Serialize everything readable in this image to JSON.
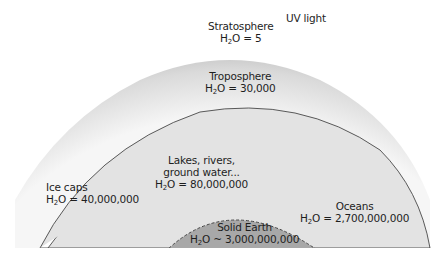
{
  "diagram": {
    "type": "earth water reservoirs cross-section",
    "labels": {
      "uv": {
        "text": "UV light"
      },
      "stratosphere": {
        "name": "Stratosphere",
        "value": "= 5"
      },
      "troposphere": {
        "name": "Troposphere",
        "value": "= 30,000"
      },
      "lakes": {
        "line1": "Lakes, rivers,",
        "line2": "ground water...",
        "value": "= 80,000,000"
      },
      "icecaps": {
        "name": "Ice caps",
        "value": "= 40,000,000"
      },
      "oceans": {
        "name": "Oceans",
        "value": "= 2,700,000,000"
      },
      "solid_earth": {
        "name": "Solid Earth",
        "value": "~ 3,000,000,000"
      }
    },
    "formula": {
      "h": "H",
      "sub": "2",
      "o": "O"
    },
    "colors": {
      "atmosphere_light": "#f4f4f4",
      "atmosphere_dark": "#bdbdbd",
      "land": "#e3e3e3",
      "ocean": "#5a5a5a",
      "ice": "#ffffff",
      "solid_earth": "#a8a8a8",
      "text": "#1e1e1e"
    }
  }
}
